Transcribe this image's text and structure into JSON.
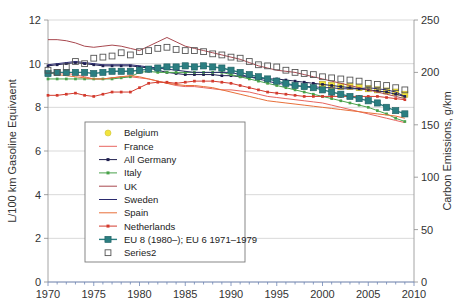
{
  "chart_data": {
    "type": "line",
    "title": "",
    "xlabel": "",
    "ylabel": "L/100 km Gasoline Equivaent",
    "y2label": "Carbon Emissions, g/km",
    "xlim": [
      1970,
      2010
    ],
    "ylim": [
      0,
      12
    ],
    "y2lim": [
      0,
      250
    ],
    "xticks": [
      1970,
      1975,
      1980,
      1985,
      1990,
      1995,
      2000,
      2005,
      2010
    ],
    "yticks": [
      0,
      2,
      4,
      6,
      8,
      10,
      12
    ],
    "y2ticks": [
      0,
      50,
      100,
      150,
      200,
      250
    ],
    "grid": true,
    "legend_position": "lower-left-inset",
    "x": [
      1970,
      1971,
      1972,
      1973,
      1974,
      1975,
      1976,
      1977,
      1978,
      1979,
      1980,
      1981,
      1982,
      1983,
      1984,
      1985,
      1986,
      1987,
      1988,
      1989,
      1990,
      1991,
      1992,
      1993,
      1994,
      1995,
      1996,
      1997,
      1998,
      1999,
      2000,
      2001,
      2002,
      2003,
      2004,
      2005,
      2006,
      2007,
      2008,
      2009
    ],
    "series": [
      {
        "name": "Belgium",
        "color": "#f2e43c",
        "marker": "square",
        "line": false,
        "values": [
          null,
          null,
          null,
          null,
          null,
          null,
          null,
          null,
          null,
          null,
          null,
          null,
          null,
          null,
          null,
          null,
          null,
          null,
          null,
          null,
          null,
          null,
          null,
          null,
          null,
          null,
          null,
          null,
          null,
          null,
          9.05,
          9.0,
          8.95,
          8.95,
          8.9,
          8.85,
          8.8,
          8.75,
          8.7,
          8.6
        ]
      },
      {
        "name": "France",
        "color": "#e8655f",
        "marker": "none",
        "line": true,
        "values": [
          9.6,
          9.6,
          9.55,
          9.5,
          9.4,
          9.3,
          9.3,
          9.35,
          9.4,
          9.4,
          9.35,
          9.3,
          9.2,
          9.1,
          9.0,
          8.95,
          8.95,
          8.9,
          8.85,
          8.8,
          8.8,
          8.75,
          8.7,
          8.6,
          8.5,
          8.45,
          8.4,
          8.35,
          8.3,
          8.25,
          8.2,
          8.1,
          8.0,
          7.9,
          7.8,
          7.7,
          7.6,
          7.5,
          7.4,
          7.3
        ]
      },
      {
        "name": "All Germany",
        "color": "#1f1f4f",
        "marker": "dot",
        "line": true,
        "values": [
          9.9,
          9.95,
          10.0,
          10.05,
          10.0,
          9.95,
          9.9,
          9.9,
          9.9,
          9.9,
          9.85,
          9.8,
          9.7,
          9.6,
          9.55,
          9.5,
          9.5,
          9.5,
          9.5,
          9.45,
          9.45,
          9.4,
          9.4,
          9.35,
          9.3,
          9.3,
          9.25,
          9.2,
          9.15,
          9.1,
          9.05,
          9.0,
          8.95,
          8.9,
          8.85,
          8.8,
          8.75,
          8.7,
          8.6,
          8.5
        ]
      },
      {
        "name": "Italy",
        "color": "#49a24a",
        "marker": "dot",
        "line": true,
        "values": [
          9.3,
          9.3,
          9.3,
          9.3,
          9.3,
          9.3,
          9.3,
          9.3,
          9.35,
          9.4,
          9.6,
          9.65,
          9.6,
          9.6,
          9.6,
          9.6,
          9.6,
          9.6,
          9.6,
          9.6,
          9.5,
          9.4,
          9.3,
          9.2,
          9.1,
          9.0,
          8.9,
          8.8,
          8.7,
          8.6,
          8.5,
          8.4,
          8.3,
          8.2,
          8.1,
          8.0,
          7.85,
          7.7,
          7.5,
          7.35
        ]
      },
      {
        "name": "UK",
        "color": "#a8484f",
        "marker": "none",
        "line": true,
        "values": [
          11.1,
          11.1,
          11.05,
          10.95,
          10.8,
          10.75,
          10.8,
          10.85,
          10.8,
          10.7,
          10.6,
          10.8,
          11.0,
          11.2,
          11.0,
          10.8,
          10.7,
          10.6,
          10.5,
          10.4,
          10.3,
          10.2,
          10.05,
          9.9,
          9.8,
          9.7,
          9.65,
          9.6,
          9.5,
          9.4,
          9.3,
          9.2,
          9.1,
          9.0,
          8.9,
          8.8,
          8.7,
          8.6,
          8.5,
          8.4
        ]
      },
      {
        "name": "Sweden",
        "color": "#2a2a6e",
        "marker": "none",
        "line": true,
        "values": [
          9.95,
          10.0,
          10.05,
          10.1,
          10.05,
          10.0,
          9.95,
          9.95,
          9.95,
          9.95,
          9.9,
          9.85,
          9.8,
          9.75,
          9.7,
          9.65,
          9.6,
          9.6,
          9.6,
          9.6,
          9.6,
          9.5,
          9.4,
          9.3,
          9.2,
          9.1,
          9.05,
          9.0,
          8.95,
          8.95,
          8.9,
          8.9,
          8.85,
          8.85,
          8.85,
          8.9,
          8.85,
          8.8,
          8.7,
          8.5
        ]
      },
      {
        "name": "Spain",
        "color": "#e8703a",
        "marker": "none",
        "line": true,
        "values": [
          9.6,
          9.5,
          9.45,
          9.4,
          9.35,
          9.3,
          9.3,
          9.35,
          9.4,
          9.45,
          9.4,
          9.3,
          9.2,
          9.1,
          9.05,
          9.0,
          9.0,
          8.95,
          8.9,
          8.8,
          8.7,
          8.6,
          8.5,
          8.4,
          8.3,
          8.25,
          8.2,
          8.15,
          8.1,
          8.05,
          8.0,
          7.95,
          7.9,
          7.85,
          7.8,
          7.75,
          7.7,
          7.65,
          7.6,
          7.5
        ]
      },
      {
        "name": "Netherlands",
        "color": "#d33b2e",
        "marker": "dot",
        "line": true,
        "values": [
          8.55,
          8.55,
          8.6,
          8.65,
          8.55,
          8.5,
          8.6,
          8.7,
          8.7,
          8.7,
          8.9,
          9.1,
          9.15,
          9.15,
          9.1,
          9.15,
          9.2,
          9.2,
          9.2,
          9.15,
          9.1,
          9.0,
          8.9,
          8.8,
          8.7,
          8.65,
          8.6,
          8.55,
          8.5,
          8.5,
          8.5,
          8.5,
          8.5,
          8.5,
          8.5,
          8.5,
          8.5,
          8.45,
          8.4,
          8.35
        ]
      },
      {
        "name": "EU 8 (1980–); EU 6 1971–1979",
        "color": "#2b7e81",
        "marker": "bigsquare",
        "line": true,
        "values": [
          9.55,
          9.6,
          9.6,
          9.6,
          9.6,
          9.55,
          9.6,
          9.65,
          9.65,
          9.65,
          9.7,
          9.75,
          9.8,
          9.85,
          9.85,
          9.9,
          9.85,
          9.9,
          9.85,
          9.8,
          9.7,
          9.6,
          9.5,
          9.4,
          9.3,
          9.2,
          9.1,
          9.0,
          8.95,
          8.9,
          8.8,
          8.7,
          8.6,
          8.5,
          8.4,
          8.3,
          8.2,
          8.0,
          7.85,
          7.7
        ]
      },
      {
        "name": "Series2",
        "color": "#555555",
        "marker": "opensquare",
        "line": false,
        "values": [
          9.7,
          9.6,
          9.85,
          10.1,
          10.0,
          10.25,
          10.3,
          10.35,
          10.5,
          10.4,
          10.55,
          10.6,
          10.7,
          10.75,
          10.65,
          10.6,
          10.6,
          10.55,
          10.45,
          10.4,
          10.3,
          10.25,
          10.1,
          9.95,
          9.9,
          9.85,
          9.7,
          9.6,
          9.55,
          9.5,
          9.4,
          9.35,
          9.3,
          9.25,
          9.2,
          9.1,
          9.05,
          9.0,
          8.9,
          8.8
        ]
      }
    ]
  },
  "legend": {
    "items": [
      {
        "label": "Belgium"
      },
      {
        "label": "France"
      },
      {
        "label": "All Germany"
      },
      {
        "label": "Italy"
      },
      {
        "label": "UK"
      },
      {
        "label": "Sweden"
      },
      {
        "label": "Spain"
      },
      {
        "label": "Netherlands"
      },
      {
        "label": "EU 8 (1980–); EU 6 1971–1979"
      },
      {
        "label": "Series2"
      }
    ]
  }
}
